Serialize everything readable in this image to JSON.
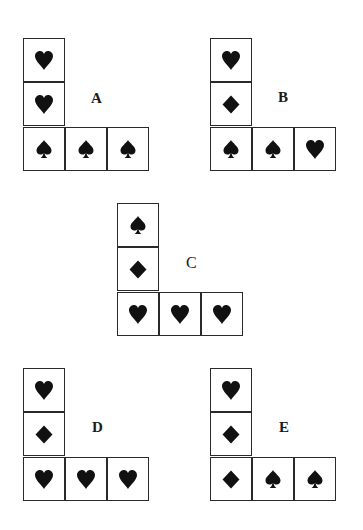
{
  "colors": {
    "line": "#2a2a2a",
    "symbol": "#111111",
    "background": "#ffffff"
  },
  "figures": [
    {
      "label": "A",
      "column": [
        "heart",
        "heart",
        "spade"
      ],
      "row": [
        "spade",
        "spade",
        "spade"
      ]
    },
    {
      "label": "B",
      "column": [
        "heart",
        "diamond",
        "spade"
      ],
      "row": [
        "spade",
        "spade",
        "heart"
      ]
    },
    {
      "label": "C",
      "column": [
        "spade",
        "diamond",
        "heart"
      ],
      "row": [
        "heart",
        "heart",
        "heart"
      ]
    },
    {
      "label": "D",
      "column": [
        "heart",
        "diamond",
        "heart"
      ],
      "row": [
        "heart",
        "heart",
        "heart"
      ]
    },
    {
      "label": "E",
      "column": [
        "heart",
        "diamond",
        "diamond"
      ],
      "row": [
        "diamond",
        "spade",
        "spade"
      ]
    }
  ]
}
